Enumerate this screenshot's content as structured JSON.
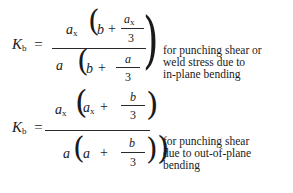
{
  "formula1": {
    "lhs": {
      "symbol": "K",
      "subscript": "b",
      "equals": "="
    },
    "numerator": {
      "factor": {
        "symbol": "a",
        "subscript": "x"
      },
      "inner_term": "b",
      "plus": "+",
      "frac_num": {
        "symbol": "a",
        "subscript": "x"
      },
      "frac_den": "3"
    },
    "denominator": {
      "factor": "a",
      "inner_term": "b",
      "plus": "+",
      "frac_num": "a",
      "frac_den": "3"
    },
    "note_lines": [
      "for punching shear or",
      "weld stress due to",
      "in-plane bending"
    ]
  },
  "formula2": {
    "lhs": {
      "symbol": "K",
      "subscript": "b",
      "equals": "="
    },
    "numerator": {
      "factor": {
        "symbol": "a",
        "subscript": "x"
      },
      "inner_term": {
        "symbol": "a",
        "subscript": "x"
      },
      "plus": "+",
      "frac_num": "b",
      "frac_den": "3"
    },
    "denominator": {
      "factor": "a",
      "inner_term": "a",
      "plus": "+",
      "frac_num": "b",
      "frac_den": "3"
    },
    "note_lines": [
      "for punching shear",
      "due to out-of-plane",
      "bending"
    ]
  }
}
